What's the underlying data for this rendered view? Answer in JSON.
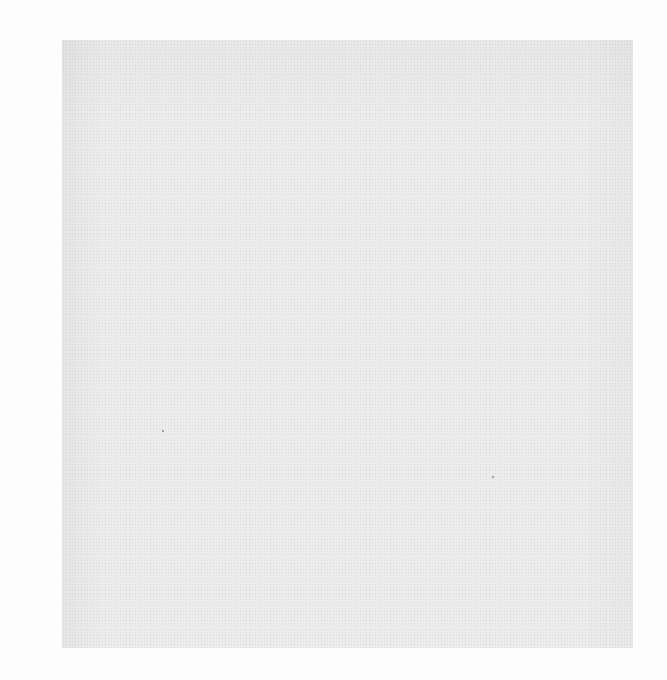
{
  "page": {
    "type": "blank scanned page",
    "background_color": "#fdfdfd",
    "scan_area_color": "#ececec",
    "text": ""
  }
}
